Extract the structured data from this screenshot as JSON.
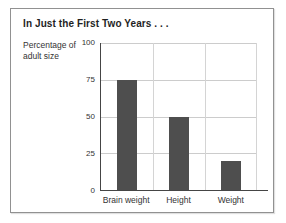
{
  "chart_data": {
    "type": "bar",
    "title": "In Just the First Two Years . . .",
    "ylabel": "Percentage of adult size",
    "xlabel": "",
    "categories": [
      "Brain weight",
      "Height",
      "Weight"
    ],
    "values": [
      75,
      50,
      20
    ],
    "ylim": [
      0,
      100
    ],
    "yticks": [
      0,
      25,
      50,
      75,
      100
    ],
    "grid": true,
    "legend": "none",
    "colors": {
      "bar": "#4e4e4e",
      "gridline": "#cccccc",
      "axis": "#454545",
      "text": "#333333",
      "card_border": "#919191",
      "card_background": "#ffffff"
    }
  }
}
